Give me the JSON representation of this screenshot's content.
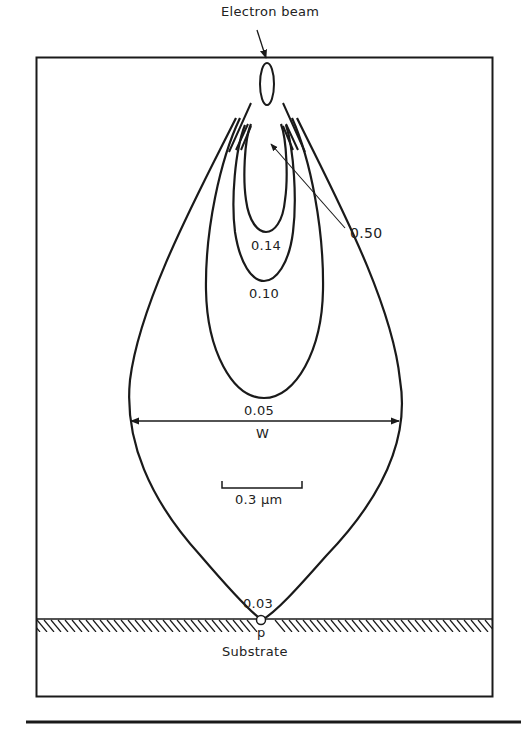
{
  "figure": {
    "title_label": "Electron beam",
    "contours": [
      {
        "value": "0.50",
        "label": "0.50"
      },
      {
        "value": "0.14",
        "label": "0.14"
      },
      {
        "value": "0.10",
        "label": "0.10"
      },
      {
        "value": "0.05",
        "label": "0.05"
      },
      {
        "value": "0.03",
        "label": "0.03"
      }
    ],
    "width_label": "W",
    "scale_bar_label": "0.3 μm",
    "point_label": "p",
    "substrate_label": "Substrate",
    "colors": {
      "ink": "#1a1a1a",
      "background": "#ffffff"
    }
  }
}
